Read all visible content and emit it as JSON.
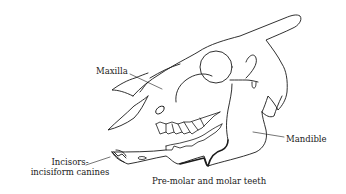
{
  "diagram": {
    "labels": {
      "maxilla": "Maxilla",
      "mandible": "Mandible",
      "incisors_line1": "Incisors-",
      "incisors_line2": "incisiform canines",
      "molars": "Pre-molar and molar teeth"
    },
    "colors": {
      "line": "#1a1a1a",
      "leader": "#777777",
      "background": "#ffffff"
    }
  }
}
